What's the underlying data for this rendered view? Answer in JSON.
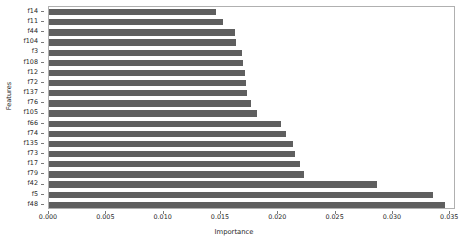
{
  "chart_data": {
    "type": "bar",
    "orientation": "horizontal",
    "title": "",
    "xlabel": "Importance",
    "ylabel": "Features",
    "categories": [
      "f14",
      "f11",
      "f44",
      "f104",
      "f3",
      "f108",
      "f12",
      "f72",
      "f137",
      "f76",
      "f105",
      "f66",
      "f74",
      "f135",
      "f73",
      "f17",
      "f79",
      "f42",
      "f5",
      "f48"
    ],
    "values": [
      0.0146,
      0.0152,
      0.0162,
      0.0163,
      0.0168,
      0.0169,
      0.0171,
      0.0172,
      0.0173,
      0.0176,
      0.0181,
      0.0202,
      0.0207,
      0.0213,
      0.0215,
      0.0219,
      0.0222,
      0.0286,
      0.0335,
      0.0345
    ],
    "xlim": [
      0.0,
      0.0355
    ],
    "xticks": [
      0.0,
      0.005,
      0.01,
      0.015,
      0.02,
      0.025,
      0.03,
      0.035
    ],
    "xticklabels": [
      "0.000",
      "0.005",
      "0.010",
      "0.015",
      "0.020",
      "0.025",
      "0.030",
      "0.035"
    ],
    "grid": false,
    "legend": null,
    "bar_color": "#5f5f5f",
    "axis_color": "#b0b0b0",
    "background_color": "#ffffff"
  }
}
